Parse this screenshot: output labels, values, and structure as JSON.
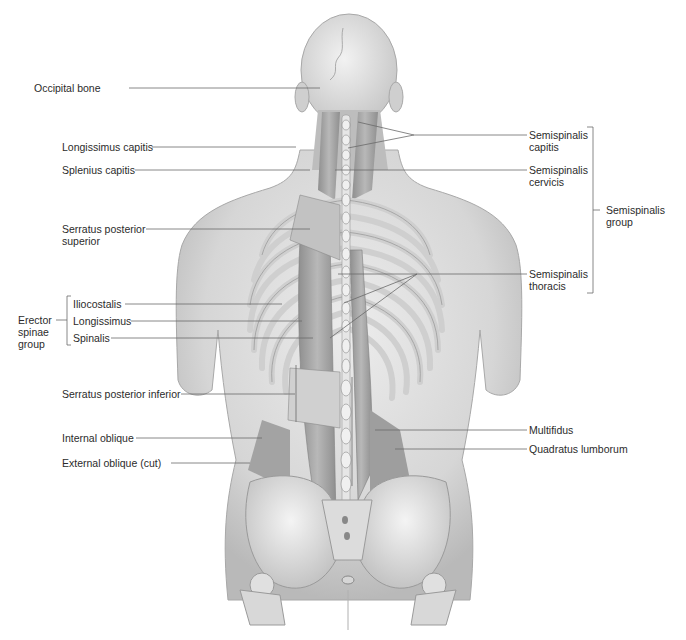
{
  "colors": {
    "background": "#ffffff",
    "leader_line": "#6a6a6a",
    "skin": "#d9d9d9",
    "bone": "#e8e8e8",
    "muscle": "#a9a9a9",
    "text": "#2b2b2b"
  },
  "labels_left": [
    {
      "id": "occipital-bone",
      "text": "Occipital bone"
    },
    {
      "id": "longissimus-capitis",
      "text": "Longissimus capitis"
    },
    {
      "id": "splenius-capitis",
      "text": "Splenius capitis"
    },
    {
      "id": "serratus-posterior-superior",
      "text": "Serratus posterior",
      "text2": "superior"
    },
    {
      "id": "iliocostalis",
      "text": "Iliocostalis"
    },
    {
      "id": "longissimus",
      "text": "Longissimus"
    },
    {
      "id": "spinalis",
      "text": "Spinalis"
    },
    {
      "id": "serratus-posterior-inferior",
      "text": "Serratus posterior inferior"
    },
    {
      "id": "internal-oblique",
      "text": "Internal oblique"
    },
    {
      "id": "external-oblique-cut",
      "text": "External oblique (cut)"
    }
  ],
  "labels_right": [
    {
      "id": "semispinalis-capitis",
      "text": "Semispinalis",
      "text2": "capitis"
    },
    {
      "id": "semispinalis-cervicis",
      "text": "Semispinalis",
      "text2": "cervicis"
    },
    {
      "id": "semispinalis-thoracis",
      "text": "Semispinalis",
      "text2": "thoracis"
    },
    {
      "id": "multifidus",
      "text": "Multifidus"
    },
    {
      "id": "quadratus-lumborum",
      "text": "Quadratus lumborum"
    }
  ],
  "groups": {
    "erector_spinae": {
      "line1": "Erector",
      "line2": "spinae",
      "line3": "group"
    },
    "semispinalis": {
      "line1": "Semispinalis",
      "line2": "group"
    }
  }
}
